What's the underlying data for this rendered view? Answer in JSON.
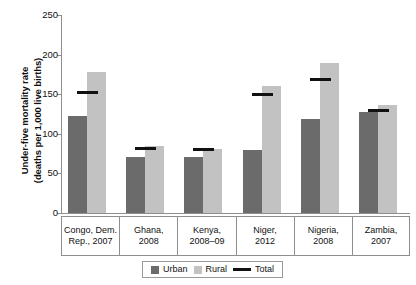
{
  "chart_data": {
    "type": "bar",
    "title": "",
    "xlabel": "",
    "ylabel": "Under-five mortality rate (deaths per 1,000 live births)",
    "ylabel_line1": "Under-five mortality rate",
    "ylabel_line2": "(deaths per 1,000 live births)",
    "ylim": [
      0,
      250
    ],
    "ytick_values": [
      0,
      50,
      100,
      150,
      200,
      250
    ],
    "ytick_labels": [
      "0",
      "50",
      "100",
      "150",
      "200",
      "250"
    ],
    "grid": false,
    "legend_position": "bottom",
    "categories": [
      "Congo, Dem. Rep., 2007",
      "Ghana, 2008",
      "Kenya, 2008–09",
      "Niger, 2012",
      "Nigeria, 2008",
      "Zambia, 2007"
    ],
    "category_lines": [
      [
        "Congo, Dem.",
        "Rep., 2007"
      ],
      [
        "Ghana,",
        "2008"
      ],
      [
        "Kenya,",
        "2008–09"
      ],
      [
        "Niger,",
        "2012"
      ],
      [
        "Nigeria,",
        "2008"
      ],
      [
        "Zambia,",
        "2007"
      ]
    ],
    "series": [
      {
        "name": "Urban",
        "type": "bar",
        "color": "#6b6b6b",
        "values": [
          122,
          71,
          71,
          80,
          119,
          127
        ]
      },
      {
        "name": "Rural",
        "type": "bar",
        "color": "#c2c2c2",
        "values": [
          178,
          84,
          81,
          160,
          189,
          137
        ]
      },
      {
        "name": "Total",
        "type": "marker",
        "color": "#111111",
        "values": [
          152,
          81,
          80,
          150,
          169,
          130
        ]
      }
    ],
    "legend": [
      "Urban",
      "Rural",
      "Total"
    ]
  }
}
